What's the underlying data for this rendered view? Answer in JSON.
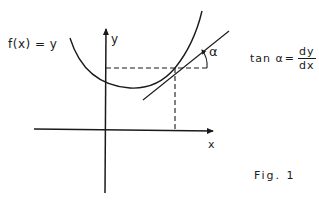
{
  "figure": {
    "caption": "Fig. 1",
    "function_label": "f(x) = y",
    "axes": {
      "x_label": "x",
      "y_label": "y"
    },
    "angle_label": "α",
    "formula": {
      "lhs": "tan α",
      "equals": "=",
      "numerator": "dy",
      "denominator": "dx"
    },
    "colors": {
      "stroke": "#1a1a1a",
      "background": "#ffffff"
    }
  }
}
